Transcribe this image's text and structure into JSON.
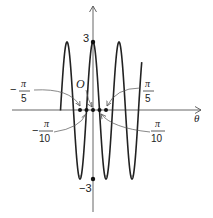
{
  "chart_data": {
    "type": "line",
    "title": "",
    "function": "y = 3cos(5θ)",
    "xlabel": "θ",
    "ylabel": "",
    "origin_label": "O",
    "y_tick_labels": [
      "3",
      "-3"
    ],
    "x_annotations": [
      {
        "label_num": "π",
        "label_den": "5",
        "sign": "-",
        "value": "-π/5"
      },
      {
        "label_num": "π",
        "label_den": "10",
        "sign": "-",
        "value": "-π/10"
      },
      {
        "label_num": "π",
        "label_den": "5",
        "sign": "",
        "value": "π/5"
      },
      {
        "label_num": "π",
        "label_den": "10",
        "sign": "",
        "value": "π/10"
      }
    ],
    "amplitude": 3,
    "period": "2π/5",
    "domain_theta": [
      -1.5708,
      2.3562
    ],
    "marked_points": [
      {
        "theta": "-π/5",
        "y": 0
      },
      {
        "theta": "-π/10",
        "y": 0
      },
      {
        "theta": "0",
        "y": 0
      },
      {
        "theta": "π/10",
        "y": 0
      },
      {
        "theta": "π/5",
        "y": 0
      },
      {
        "theta": "0",
        "y": 3
      },
      {
        "theta": "0",
        "y": -3
      }
    ],
    "ylim": [
      -3,
      3
    ],
    "grid": false,
    "legend": false
  },
  "labels": {
    "y_top": "3",
    "y_bottom": "−3",
    "origin": "O",
    "theta": "θ",
    "pi": "π",
    "five": "5",
    "ten": "10",
    "minus": "−"
  }
}
